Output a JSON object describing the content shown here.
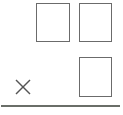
{
  "problem": {
    "type": "vertical-multiplication",
    "operator": "×",
    "multiplicand": {
      "digits": [
        {
          "position": "tens",
          "value": ""
        },
        {
          "position": "ones",
          "value": ""
        }
      ]
    },
    "multiplier": {
      "digits": [
        {
          "position": "ones",
          "value": ""
        }
      ]
    }
  },
  "colors": {
    "box_border": "#6b6b6b",
    "line": "#6a6e68",
    "operator": "#555555",
    "background": "#ffffff"
  }
}
